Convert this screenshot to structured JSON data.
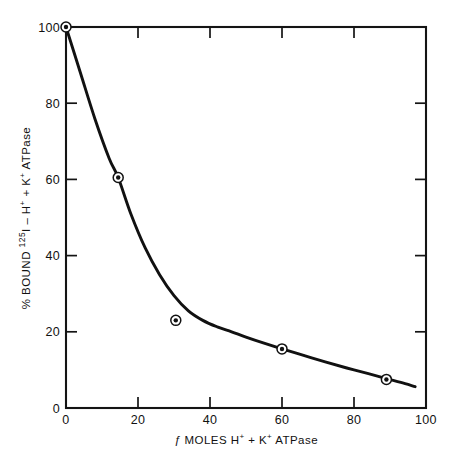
{
  "chart_data": {
    "type": "line",
    "title": "",
    "xlabel_parts": {
      "prefix": "ƒ",
      "main": " MOLES H",
      "sup1": "+",
      "mid": " + K",
      "sup2": "+",
      "suffix": " ATPase"
    },
    "xlabel": "ƒ MOLES H+ + K+ ATPase",
    "ylabel_parts": {
      "prefix": "% BOUND ",
      "iso_sup": "125",
      "iso": "I",
      "main": " – H",
      "sup1": "+",
      "mid": " + K",
      "sup2": "+",
      "suffix": " ATPase"
    },
    "ylabel": "% BOUND 125I – H+ + K+ ATPase",
    "xlim": [
      0,
      100
    ],
    "ylim": [
      0,
      100
    ],
    "xticks": [
      0,
      20,
      40,
      60,
      80,
      100
    ],
    "yticks": [
      0,
      20,
      40,
      60,
      80,
      100
    ],
    "xtick_labels": [
      "0",
      "20",
      "40",
      "60",
      "80",
      "100"
    ],
    "ytick_labels": [
      "0",
      "20",
      "40",
      "60",
      "80",
      "100"
    ],
    "grid": false,
    "legend": null,
    "frame": "box",
    "tick_direction": "in",
    "marker_style": "bullseye",
    "series": [
      {
        "name": "% bound",
        "marker_points": [
          {
            "x": 0,
            "y": 100
          },
          {
            "x": 14.5,
            "y": 60.5
          },
          {
            "x": 30.5,
            "y": 23.0
          },
          {
            "x": 60.0,
            "y": 15.5
          },
          {
            "x": 89.0,
            "y": 7.5
          }
        ],
        "curve_points": [
          {
            "x": 0,
            "y": 100
          },
          {
            "x": 4,
            "y": 88
          },
          {
            "x": 8,
            "y": 76
          },
          {
            "x": 12,
            "y": 65.5
          },
          {
            "x": 14.5,
            "y": 60.5
          },
          {
            "x": 18,
            "y": 51
          },
          {
            "x": 22,
            "y": 42
          },
          {
            "x": 26,
            "y": 35
          },
          {
            "x": 30,
            "y": 29.5
          },
          {
            "x": 34,
            "y": 25.5
          },
          {
            "x": 38,
            "y": 23
          },
          {
            "x": 42,
            "y": 21.3
          },
          {
            "x": 46,
            "y": 20
          },
          {
            "x": 50,
            "y": 18.6
          },
          {
            "x": 55,
            "y": 17
          },
          {
            "x": 60,
            "y": 15.5
          },
          {
            "x": 66,
            "y": 13.8
          },
          {
            "x": 72,
            "y": 12.1
          },
          {
            "x": 78,
            "y": 10.5
          },
          {
            "x": 84,
            "y": 9.0
          },
          {
            "x": 89,
            "y": 7.7
          },
          {
            "x": 93,
            "y": 6.7
          },
          {
            "x": 97,
            "y": 5.6
          }
        ]
      }
    ],
    "colors": {
      "line": "#111111",
      "marker": "#111111",
      "axis": "#141414",
      "background": "#ffffff"
    }
  }
}
